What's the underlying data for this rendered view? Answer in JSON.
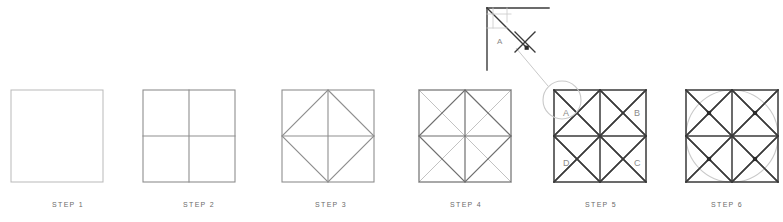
{
  "page": {
    "kind": "geometric-construction-steps",
    "background_color": "#ffffff",
    "width": 783,
    "height": 222
  },
  "palette": {
    "outline_light": "#b9b9b9",
    "outline_mid": "#8f8f8f",
    "outline_dark": "#4a4a4a",
    "ink_black": "#3a3a3a",
    "guide_gray": "#c2c2c2",
    "circle_gray": "#c9c9c9",
    "caption_gray": "#6b6b6b",
    "label_gray": "#8a8a8a",
    "marker_black": "#2b2b2b"
  },
  "steps": [
    {
      "id": "step-1",
      "caption": "STEP 1",
      "caption_x": 68,
      "caption_y": 201,
      "square": {
        "x": 11,
        "y": 90,
        "size": 92
      },
      "stroke": "#b9b9b9",
      "stroke_width": 1,
      "features": [],
      "corner_labels": []
    },
    {
      "id": "step-2",
      "caption": "STEP 2",
      "caption_x": 199,
      "caption_y": 201,
      "square": {
        "x": 143,
        "y": 90,
        "size": 92
      },
      "stroke": "#8f8f8f",
      "stroke_width": 1.1,
      "features": [
        "cross"
      ],
      "corner_labels": []
    },
    {
      "id": "step-3",
      "caption": "STEP 3",
      "caption_x": 331,
      "caption_y": 201,
      "square": {
        "x": 282,
        "y": 90,
        "size": 92
      },
      "stroke": "#8f8f8f",
      "stroke_width": 1.1,
      "features": [
        "cross",
        "diamond"
      ],
      "corner_labels": []
    },
    {
      "id": "step-4",
      "caption": "STEP 4",
      "caption_x": 466,
      "caption_y": 201,
      "square": {
        "x": 419,
        "y": 90,
        "size": 92
      },
      "stroke": "#6f6f6f",
      "stroke_width": 1.2,
      "features": [
        "cross",
        "diamond",
        "corner-diagonals"
      ],
      "corner_labels": []
    },
    {
      "id": "step-5",
      "caption": "STEP 5",
      "caption_x": 601,
      "caption_y": 201,
      "square": {
        "x": 554,
        "y": 90,
        "size": 92
      },
      "stroke": "#3a3a3a",
      "stroke_width": 1.5,
      "features": [
        "cross",
        "diamond",
        "corner-diagonals",
        "quarter-diagonals"
      ],
      "corner_labels": [
        {
          "text": "A",
          "x": 563,
          "y": 116
        },
        {
          "text": "B",
          "x": 634,
          "y": 116
        },
        {
          "text": "C",
          "x": 634,
          "y": 166
        },
        {
          "text": "D",
          "x": 563,
          "y": 166
        }
      ]
    },
    {
      "id": "step-6",
      "caption": "STEP 6",
      "caption_x": 727,
      "caption_y": 201,
      "square": {
        "x": 686,
        "y": 90,
        "size": 92
      },
      "stroke": "#3a3a3a",
      "stroke_width": 1.5,
      "features": [
        "cross",
        "diamond",
        "corner-diagonals",
        "quarter-diagonals",
        "inscribed-circle",
        "node-markers"
      ],
      "corner_labels": []
    }
  ],
  "callout": {
    "id": "magnifier-callout",
    "lens": {
      "cx": 562,
      "cy": 100,
      "r": 19
    },
    "leader": {
      "x1": 548,
      "y1": 86,
      "x2": 516,
      "y2": 48
    },
    "detail": {
      "origin_x": 487,
      "origin_y": 8,
      "size": 40,
      "label": "A",
      "label_x": 497,
      "label_y": 44,
      "x_mark_cx": 525,
      "x_mark_cy": 42,
      "x_mark_r": 10
    }
  }
}
